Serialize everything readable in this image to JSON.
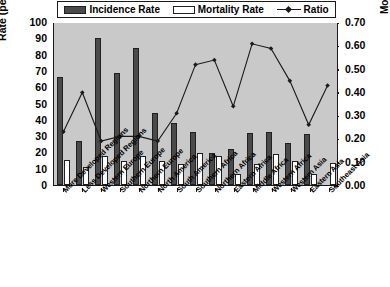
{
  "chart_data": {
    "type": "bar",
    "title": "",
    "xlabel": "",
    "ylabel": "Rate (per 100,000)",
    "y2label": "Mortality-to-Incidence Ratio",
    "ylim": [
      0,
      100
    ],
    "y2lim": [
      0.0,
      0.7
    ],
    "grid": false,
    "legend_position": "top",
    "categories": [
      "More Developed Regions",
      "Less Developed Regions",
      "Western Europe",
      "Southern Europe",
      "Northern Europe",
      "North America",
      "South America",
      "Southern Africa",
      "Northern Africa",
      "Eastern Africa",
      "Middle Africa",
      "Western Africa",
      "Western Asia",
      "Eastern Asia",
      "Southeast Asia"
    ],
    "series": [
      {
        "name": "Incidence Rate",
        "axis": "left",
        "kind": "bar",
        "color": "#4a4a4a",
        "values": [
          66,
          27,
          90,
          68.5,
          84,
          44,
          38,
          32.5,
          19.5,
          22,
          32,
          32.5,
          25.5,
          31,
          0
        ]
      },
      {
        "name": "Mortality Rate",
        "axis": "left",
        "kind": "bar",
        "color": "#ffffff",
        "values": [
          15.5,
          11,
          17.5,
          15,
          17.5,
          15,
          13,
          19.5,
          18,
          6.5,
          13,
          19,
          14.5,
          6.5,
          13.5
        ]
      },
      {
        "name": "Ratio",
        "axis": "right",
        "kind": "line",
        "color": "#1a1a1a",
        "values": [
          0.23,
          0.4,
          0.19,
          0.21,
          0.21,
          0.19,
          0.31,
          0.52,
          0.54,
          0.34,
          0.61,
          0.59,
          0.45,
          0.26,
          0.43
        ]
      }
    ],
    "yticks_left": [
      "0",
      "10",
      "20",
      "30",
      "40",
      "50",
      "60",
      "70",
      "80",
      "90",
      "100"
    ],
    "yticks_right": [
      "0.00",
      "0.10",
      "0.20",
      "0.30",
      "0.40",
      "0.50",
      "0.60",
      "0.70"
    ]
  },
  "legend": {
    "items": [
      {
        "label": "Incidence Rate",
        "swatch": "filled-bar-swatch"
      },
      {
        "label": "Mortality Rate",
        "swatch": "hollow-bar-swatch"
      },
      {
        "label": "Ratio",
        "swatch": "line-marker-swatch"
      }
    ]
  }
}
